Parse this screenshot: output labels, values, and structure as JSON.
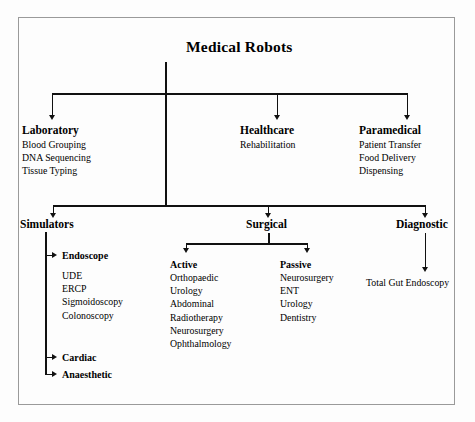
{
  "diagram": {
    "title": "Medical Robots",
    "tier1": [
      {
        "label": "Laboratory",
        "items": [
          "Blood Grouping",
          "DNA Sequencing",
          "Tissue Typing"
        ]
      },
      {
        "label": "Healthcare",
        "items": [
          "Rehabilitation"
        ]
      },
      {
        "label": "Paramedical",
        "items": [
          "Patient Transfer",
          "Food Delivery",
          "Dispensing"
        ]
      }
    ],
    "tier2": [
      {
        "label": "Simulators",
        "groups": [
          {
            "label": "Endoscope",
            "items": [
              "UDE",
              "ERCP",
              "Sigmoidoscopy",
              "Colonoscopy"
            ]
          },
          {
            "label": "Cardiac",
            "items": []
          },
          {
            "label": "Anaesthetic",
            "items": []
          }
        ]
      },
      {
        "label": "Surgical",
        "groups": [
          {
            "label": "Active",
            "items": [
              "Orthopaedic",
              "Urology",
              "Abdominal",
              "Radiotherapy",
              "Neurosurgery",
              "Ophthalmology"
            ]
          },
          {
            "label": "Passive",
            "items": [
              "Neurosurgery",
              "ENT",
              "Urology",
              "Dentistry"
            ]
          }
        ]
      },
      {
        "label": "Diagnostic",
        "groups": [
          {
            "label": "Total Gut Endoscopy",
            "items": []
          }
        ]
      }
    ]
  },
  "style": {
    "line_color": "#111111",
    "border_color": "#9a9a9a",
    "text_color": "#000000"
  }
}
